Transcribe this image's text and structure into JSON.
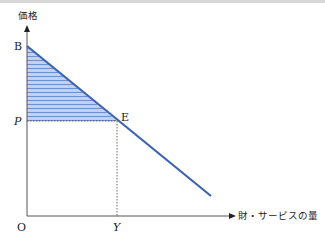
{
  "diagram": {
    "y_axis_label": "価格",
    "x_axis_label": "財・サービスの量",
    "origin_label": "O",
    "point_b_label": "B",
    "point_e_label": "E",
    "price_label": "P",
    "quantity_label": "Y",
    "colors": {
      "demand_line": "#3a63b0",
      "shading_fill": "#b8c8ea",
      "shading_lines": "#5a7fc4",
      "axis": "#555555"
    }
  }
}
